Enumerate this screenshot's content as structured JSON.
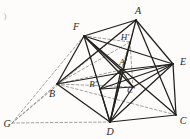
{
  "figure": {
    "caption_mark": ")",
    "background_color": "#fdfcfb",
    "stroke_color": "#221f1c",
    "dashed_color": "#8d8780",
    "vertices": [
      {
        "id": "A",
        "label": "A",
        "x": 136,
        "y": 20,
        "label_x": 138,
        "label_y": 11,
        "kind": "outer"
      },
      {
        "id": "B",
        "label": "B",
        "x": 57,
        "y": 84,
        "label_x": 52,
        "label_y": 94,
        "kind": "outer"
      },
      {
        "id": "C",
        "label": "C",
        "x": 176,
        "y": 115,
        "label_x": 183,
        "label_y": 121,
        "kind": "outer"
      },
      {
        "id": "D",
        "label": "D",
        "x": 110,
        "y": 122,
        "label_x": 110,
        "label_y": 132,
        "kind": "outer"
      },
      {
        "id": "E",
        "label": "E",
        "x": 173,
        "y": 64,
        "label_x": 183,
        "label_y": 62,
        "kind": "outer"
      },
      {
        "id": "F",
        "label": "F",
        "x": 84,
        "y": 36,
        "label_x": 76,
        "label_y": 27,
        "kind": "outer"
      },
      {
        "id": "G",
        "label": "G",
        "x": 12,
        "y": 123,
        "label_x": 7,
        "label_y": 124,
        "kind": "external"
      },
      {
        "id": "Ap",
        "label": "A'",
        "x": 121,
        "y": 70,
        "label_x": 123,
        "label_y": 62,
        "kind": "inner"
      },
      {
        "id": "Bp",
        "label": "B'",
        "x": 100,
        "y": 89,
        "label_x": 93,
        "label_y": 84,
        "kind": "inner"
      },
      {
        "id": "Cp",
        "label": "C'",
        "x": 133,
        "y": 87,
        "label_x": 131,
        "label_y": 90,
        "kind": "inner"
      },
      {
        "id": "Hp",
        "label": "H'",
        "x": 130,
        "y": 42,
        "label_x": 125,
        "label_y": 37,
        "kind": "inner"
      }
    ],
    "solid_edges": [
      [
        "A",
        "F"
      ],
      [
        "A",
        "E"
      ],
      [
        "A",
        "B"
      ],
      [
        "A",
        "D"
      ],
      [
        "A",
        "C"
      ],
      [
        "F",
        "B"
      ],
      [
        "F",
        "D"
      ],
      [
        "F",
        "E"
      ],
      [
        "F",
        "C"
      ],
      [
        "B",
        "D"
      ],
      [
        "B",
        "E"
      ],
      [
        "D",
        "C"
      ],
      [
        "D",
        "E"
      ],
      [
        "E",
        "C"
      ],
      [
        "F",
        "Cp"
      ],
      [
        "F",
        "Ap"
      ],
      [
        "D",
        "Ap"
      ],
      [
        "D",
        "Bp"
      ],
      [
        "D",
        "Cp"
      ],
      [
        "D",
        "Hp"
      ],
      [
        "E",
        "Ap"
      ],
      [
        "E",
        "Bp"
      ],
      [
        "E",
        "Cp"
      ],
      [
        "Ap",
        "Bp"
      ],
      [
        "Ap",
        "Cp"
      ],
      [
        "Bp",
        "Cp"
      ]
    ],
    "dashed_edges": [
      [
        "G",
        "F"
      ],
      [
        "G",
        "B"
      ],
      [
        "G",
        "D"
      ],
      [
        "G",
        "A"
      ],
      [
        "B",
        "Hp"
      ],
      [
        "B",
        "Ap"
      ],
      [
        "B",
        "Cp"
      ],
      [
        "F",
        "Hp"
      ],
      [
        "A",
        "Hp"
      ],
      [
        "Hp",
        "Ap"
      ],
      [
        "Hp",
        "Cp"
      ],
      [
        "B",
        "C"
      ]
    ]
  }
}
